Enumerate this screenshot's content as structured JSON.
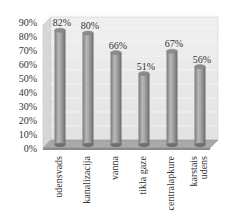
{
  "chart_data": {
    "type": "bar",
    "style": "3d-cylinder",
    "title": "",
    "xlabel": "",
    "ylabel": "",
    "ylim": [
      0,
      90
    ],
    "y_ticks": [
      "0%",
      "10%",
      "20%",
      "30%",
      "40%",
      "50%",
      "60%",
      "70%",
      "80%",
      "90%"
    ],
    "grid": true,
    "legend": null,
    "categories": [
      [
        "udensvads"
      ],
      [
        "kanalizacija"
      ],
      [
        "vanna"
      ],
      [
        "tikla gaze"
      ],
      [
        "centralapkure"
      ],
      [
        "karstais",
        "udens"
      ]
    ],
    "values": [
      82,
      80,
      66,
      51,
      67,
      56
    ],
    "data_labels": [
      "82%",
      "80%",
      "66%",
      "51%",
      "67%",
      "56%"
    ],
    "colors": {
      "bar": "#9a9a9a",
      "bar_highlight": "#c4c4c4",
      "bar_shadow": "#6f6f6f",
      "wall": "#ebebeb",
      "side_wall": "#d6d6d6",
      "floor": "#a9a9a9",
      "grid": "#f8f8f8",
      "text": "#333333"
    }
  }
}
